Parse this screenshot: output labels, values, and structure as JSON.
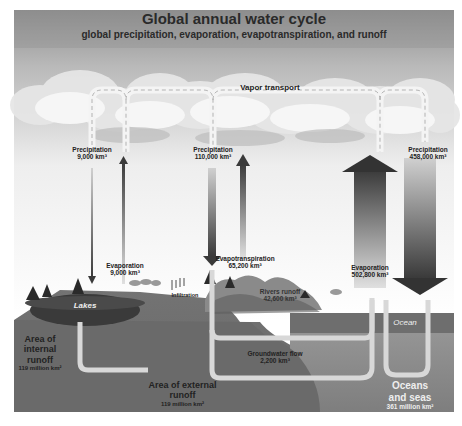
{
  "header": {
    "title": "Global annual water cycle",
    "subtitle": "global precipitation, evaporation, evapotranspiration, and runoff"
  },
  "labels": {
    "vapor_transport": "Vapor transport",
    "precip_internal": {
      "name": "Precipitation",
      "value": "9,000 km³"
    },
    "precip_land": {
      "name": "Precipitation",
      "value": "110,000 km³"
    },
    "precip_ocean": {
      "name": "Precipitation",
      "value": "458,000 km³"
    },
    "evap_internal": {
      "name": "Evaporation",
      "value": "9,000 km³"
    },
    "evapotranspiration": {
      "name": "Evapotranspiration",
      "value": "65,200 km³"
    },
    "evap_ocean": {
      "name": "Evaporation",
      "value": "502,800 km³"
    },
    "infiltration": "Infiltration",
    "rivers_runoff": {
      "name": "Rivers runoff",
      "value": "42,600 km³"
    },
    "lakes": "Lakes",
    "ocean": "Ocean",
    "groundwater_flow": {
      "name": "Groundwater flow",
      "value": "2,200 km³"
    },
    "internal_runoff": {
      "line1": "Area of",
      "line2": "internal",
      "line3": "runoff",
      "value": "119 million km²"
    },
    "external_runoff": {
      "line1": "Area of external",
      "line2": "runoff",
      "value": "119 million km²"
    },
    "oceans_seas": {
      "line1": "Oceans",
      "line2": "and seas",
      "value": "361 million km²"
    }
  },
  "colors": {
    "sky_top": "#8a8a8a",
    "sky_bottom": "#ffffff",
    "cloud": "#e8e8e8",
    "ground": "#6e6e6e",
    "ocean_surface": "#7a7a7a",
    "ocean_deep": "#8c8c8c",
    "arrow_dark": "#3a3a3a",
    "arrow_light": "#b8b8b8"
  }
}
